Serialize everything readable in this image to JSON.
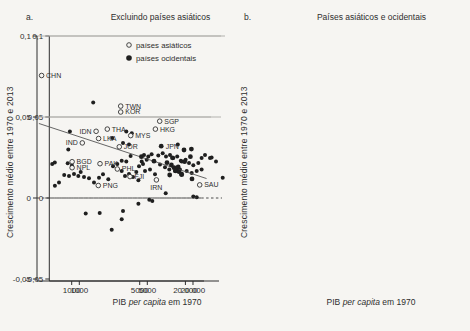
{
  "page": {
    "background": "#f6f5f2",
    "ink": "#2e2e2e",
    "dot_color": "#1f1f1f",
    "grid_color": "#b3b2ae"
  },
  "chart_data": [
    {
      "type": "scatter",
      "panel_tag": "a.",
      "title": "Excluindo países asiáticos",
      "ylabel": "Crescimento médio entre 1970 e 2013",
      "xlabel_parts": [
        "PIB ",
        "per capita",
        " em 1970"
      ],
      "xscale": "log",
      "x_ticks": [
        1000,
        5000,
        20000
      ],
      "x_tick_labels": [
        "1000",
        "5000",
        "20 000"
      ],
      "y_ticks": [
        0.1,
        0.05,
        0,
        -0.05
      ],
      "y_tick_labels": [
        "0,1",
        "0,05",
        "0",
        "-0,05"
      ],
      "ylim": [
        -0.05,
        0.1
      ],
      "grid": "horizontal",
      "zero_line": "dashed",
      "points": [
        [
          1390,
          0.059
        ],
        [
          800,
          0.041
        ],
        [
          2180,
          0.037
        ],
        [
          3040,
          0.041
        ],
        [
          3460,
          0.04
        ],
        [
          2810,
          0.034
        ],
        [
          3240,
          0.033
        ],
        [
          770,
          0.03
        ],
        [
          560,
          0.022
        ],
        [
          760,
          0.0215
        ],
        [
          840,
          0.02
        ],
        [
          2220,
          0.0196
        ],
        [
          2730,
          0.023
        ],
        [
          3370,
          0.026
        ],
        [
          12600,
          0.033
        ],
        [
          4620,
          0.0266
        ],
        [
          5150,
          0.0256
        ],
        [
          5700,
          0.027
        ],
        [
          6980,
          0.0262
        ],
        [
          7980,
          0.0276
        ],
        [
          8810,
          0.0256
        ],
        [
          9950,
          0.0266
        ],
        [
          11000,
          0.0246
        ],
        [
          12400,
          0.0256
        ],
        [
          13800,
          0.023
        ],
        [
          16000,
          0.0236
        ],
        [
          17700,
          0.0216
        ],
        [
          20200,
          0.0202
        ],
        [
          23500,
          0.0216
        ],
        [
          26000,
          0.0246
        ],
        [
          28800,
          0.0266
        ],
        [
          33500,
          0.0246
        ],
        [
          35200,
          0.025
        ],
        [
          40200,
          0.0226
        ],
        [
          14200,
          0.0226
        ],
        [
          4930,
          0.0236
        ],
        [
          4380,
          0.0226
        ],
        [
          527,
          0.021
        ],
        [
          700,
          0.0142
        ],
        [
          784,
          0.0136
        ],
        [
          883,
          0.0149
        ],
        [
          977,
          0.0136
        ],
        [
          1033,
          0.0161
        ],
        [
          1117,
          0.013
        ],
        [
          1259,
          0.0122
        ],
        [
          1416,
          0.0095
        ],
        [
          1593,
          0.0125
        ],
        [
          1754,
          0.0146
        ],
        [
          1986,
          0.0116
        ],
        [
          2460,
          0.021
        ],
        [
          2729,
          0.0166
        ],
        [
          2951,
          0.0136
        ],
        [
          3243,
          0.0149
        ],
        [
          3565,
          0.013
        ],
        [
          3855,
          0.0161
        ],
        [
          4111,
          0.0196
        ],
        [
          4519,
          0.021
        ],
        [
          3041,
          0.0226
        ],
        [
          4046,
          0.011
        ],
        [
          618,
          0.0095
        ],
        [
          562,
          0.0075
        ],
        [
          5433,
          0.0176
        ],
        [
          6310,
          0.0146
        ],
        [
          7345,
          0.0206
        ],
        [
          8550,
          0.019
        ],
        [
          9750,
          0.0176
        ],
        [
          11590,
          0.0166
        ],
        [
          13490,
          0.0176
        ],
        [
          16520,
          0.0166
        ],
        [
          19230,
          0.0155
        ],
        [
          22390,
          0.0166
        ],
        [
          26000,
          0.0176
        ],
        [
          4732,
          0.0166
        ],
        [
          49200,
          0.0125
        ],
        [
          1164,
          -0.0095
        ],
        [
          1622,
          -0.0092
        ],
        [
          2813,
          -0.008
        ],
        [
          2729,
          -0.0131
        ],
        [
          2153,
          -0.0196
        ],
        [
          4046,
          -0.0035
        ],
        [
          5823,
          -0.0019
        ],
        [
          8730,
          0.0029
        ],
        [
          20180,
          0.0009
        ],
        [
          22390,
          0.0005
        ],
        [
          5309,
          -0.0011
        ]
      ]
    },
    {
      "type": "scatter",
      "panel_tag": "b.",
      "title": "Países asiáticos e ocidentais",
      "ylabel": "Crescimento médio entre 1970 e 2013",
      "xlabel_parts": [
        "PIB ",
        "per capita",
        " em 1970"
      ],
      "xscale": "log",
      "x_ticks": [
        1000,
        5000,
        20000
      ],
      "x_tick_labels": [
        "1000",
        "5000",
        "20 000"
      ],
      "y_ticks": [
        0.1,
        0.05,
        0,
        -0.05
      ],
      "y_tick_labels": [
        "0,1",
        "0,05",
        "0",
        "-0,05"
      ],
      "ylim": [
        -0.05,
        0.1
      ],
      "grid": "horizontal",
      "zero_line": "dashed",
      "legend": {
        "position": "top-right",
        "items": [
          {
            "label": "países asiáticos",
            "marker": "open"
          },
          {
            "label": "países ocidentais",
            "marker": "filled"
          }
        ]
      },
      "trendline": {
        "x1": 460,
        "y1": 0.046,
        "x2": 38000,
        "y2": 0.012
      },
      "series": [
        {
          "name": "países asiáticos",
          "marker": "open",
          "points": [
            {
              "code": "CHN",
              "x": 490,
              "y": 0.0756,
              "label_side": "right"
            },
            {
              "code": "TWN",
              "x": 3190,
              "y": 0.0567,
              "label_side": "right"
            },
            {
              "code": "KOR",
              "x": 3190,
              "y": 0.0531,
              "label_side": "right"
            },
            {
              "code": "SGP",
              "x": 9180,
              "y": 0.0474,
              "label_side": "right"
            },
            {
              "code": "HKG",
              "x": 8050,
              "y": 0.0425,
              "label_side": "right"
            },
            {
              "code": "THA",
              "x": 2320,
              "y": 0.0425,
              "label_side": "right"
            },
            {
              "code": "IDN",
              "x": 1780,
              "y": 0.0412,
              "label_side": "left"
            },
            {
              "code": "MYS",
              "x": 4040,
              "y": 0.0385,
              "label_side": "right"
            },
            {
              "code": "LKA",
              "x": 1890,
              "y": 0.0367,
              "label_side": "right"
            },
            {
              "code": "IND",
              "x": 1285,
              "y": 0.034,
              "label_side": "left"
            },
            {
              "code": "JOR",
              "x": 3085,
              "y": 0.0316,
              "label_side": "right"
            },
            {
              "code": "BGD",
              "x": 1010,
              "y": 0.0224,
              "label_side": "right"
            },
            {
              "code": "PAK",
              "x": 1954,
              "y": 0.0212,
              "label_side": "right"
            },
            {
              "code": "NPL",
              "x": 1010,
              "y": 0.0187,
              "label_side": "right"
            },
            {
              "code": "PHL",
              "x": 2941,
              "y": 0.0179,
              "label_side": "right"
            },
            {
              "code": "FJI",
              "x": 3972,
              "y": 0.0132,
              "label_side": "right"
            },
            {
              "code": "IRN",
              "x": 8300,
              "y": 0.0112,
              "label_side": "below"
            },
            {
              "code": "PNG",
              "x": 1875,
              "y": 0.0077,
              "label_side": "right"
            },
            {
              "code": "SAU",
              "x": 30850,
              "y": 0.0081,
              "label_side": "right"
            }
          ]
        },
        {
          "name": "países ocidentais",
          "marker": "filled",
          "points": [
            {
              "code": "JPN",
              "x": 9600,
              "y": 0.032,
              "label_side": "right"
            },
            {
              "x": 5265,
              "y": 0.0255
            },
            {
              "x": 7710,
              "y": 0.0227
            },
            {
              "x": 11450,
              "y": 0.0218
            },
            {
              "x": 13080,
              "y": 0.0204
            },
            {
              "x": 14160,
              "y": 0.0187
            },
            {
              "x": 15240,
              "y": 0.0173
            },
            {
              "x": 16330,
              "y": 0.0163
            },
            {
              "x": 17880,
              "y": 0.0144
            },
            {
              "x": 12440,
              "y": 0.0142
            },
            {
              "x": 17700,
              "y": 0.0148
            },
            {
              "x": 19550,
              "y": 0.0224
            },
            {
              "x": 19150,
              "y": 0.0296
            },
            {
              "x": 23980,
              "y": 0.0302
            },
            {
              "x": 24430,
              "y": 0.0118
            },
            {
              "x": 23280,
              "y": 0.0255
            },
            {
              "x": 13500,
              "y": 0.0248
            },
            {
              "x": 14800,
              "y": 0.0168
            },
            {
              "x": 16100,
              "y": 0.0192
            }
          ]
        }
      ]
    }
  ]
}
